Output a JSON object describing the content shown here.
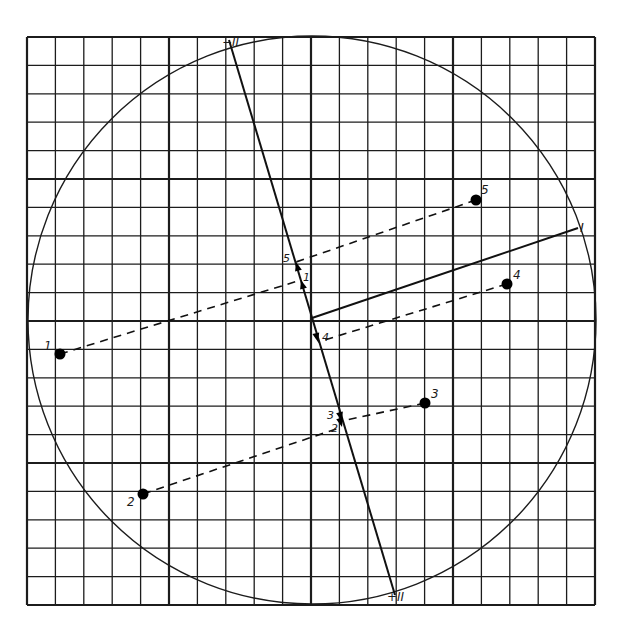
{
  "figure": {
    "type": "principal-component-projection-diagram",
    "grid": {
      "cells": 20,
      "major_every": 5,
      "left": 27,
      "top": 37,
      "right": 595,
      "bottom": 605
    },
    "circle": {
      "cx": 312,
      "cy": 320,
      "r": 284
    },
    "origin": {
      "x": 312,
      "y": 318
    },
    "axes": [
      {
        "id": "I",
        "label": "I",
        "from": [
          312,
          318
        ],
        "to": [
          578,
          228
        ],
        "label_pos": [
          580,
          232
        ]
      },
      {
        "id": "II",
        "label_neg": "−II",
        "label_pos_text": "+II",
        "from": [
          229,
          40
        ],
        "to": [
          395,
          595
        ],
        "label_neg_pos": [
          222,
          46
        ],
        "label_pos_pos": [
          387,
          601
        ]
      }
    ],
    "points": [
      {
        "label": "1",
        "x": 60,
        "y": 354,
        "label_x": 44,
        "label_y": 350,
        "proj": [
          301,
          280
        ]
      },
      {
        "label": "2",
        "x": 143,
        "y": 494,
        "label_x": 127,
        "label_y": 506,
        "proj": [
          342,
          427
        ]
      },
      {
        "label": "3",
        "x": 425,
        "y": 403,
        "label_x": 431,
        "label_y": 398,
        "proj": [
          342,
          421
        ]
      },
      {
        "label": "4",
        "x": 507,
        "y": 284,
        "label_x": 513,
        "label_y": 279,
        "proj": [
          318,
          342
        ]
      },
      {
        "label": "5",
        "x": 476,
        "y": 200,
        "label_x": 481,
        "label_y": 194,
        "proj": [
          296,
          262
        ]
      }
    ],
    "projection_labels": [
      {
        "text": "5",
        "x": 283,
        "y": 262
      },
      {
        "text": "1",
        "x": 303,
        "y": 281
      },
      {
        "text": "4",
        "x": 322,
        "y": 341
      },
      {
        "text": "3",
        "x": 327,
        "y": 419
      },
      {
        "text": "2",
        "x": 331,
        "y": 432
      }
    ]
  }
}
